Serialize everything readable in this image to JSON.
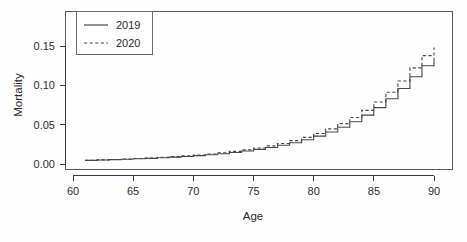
{
  "chart_data": {
    "type": "line",
    "title": "",
    "subtitle": "",
    "xlabel": "Age",
    "ylabel": "Mortality",
    "xlim": [
      60,
      90.5
    ],
    "ylim": [
      -0.004,
      0.168
    ],
    "grid": false,
    "step": true,
    "step_type": "hv",
    "legend_position": "top-left",
    "xticks": [
      60,
      65,
      70,
      75,
      80,
      85,
      90
    ],
    "xtick_labels": [
      "60",
      "65",
      "70",
      "75",
      "80",
      "85",
      "90"
    ],
    "yticks": [
      0.0,
      0.05,
      0.1,
      0.15
    ],
    "ytick_labels": [
      "0.00",
      "0.05",
      "0.10",
      "0.15"
    ],
    "x": [
      61,
      62,
      63,
      64,
      65,
      66,
      67,
      68,
      69,
      70,
      71,
      72,
      73,
      74,
      75,
      76,
      77,
      78,
      79,
      80,
      81,
      82,
      83,
      84,
      85,
      86,
      87,
      88,
      89,
      90
    ],
    "series": [
      {
        "name": "2019",
        "style": "solid",
        "color": "#474747",
        "values": [
          0.0046,
          0.005,
          0.0055,
          0.006,
          0.0066,
          0.0072,
          0.0079,
          0.0087,
          0.0096,
          0.0106,
          0.0118,
          0.0131,
          0.0147,
          0.0165,
          0.0186,
          0.021,
          0.0238,
          0.0271,
          0.0309,
          0.0354,
          0.0406,
          0.0467,
          0.0538,
          0.0621,
          0.0717,
          0.0829,
          0.0959,
          0.111,
          0.1248,
          0.135
        ]
      },
      {
        "name": "2020",
        "style": "dashed",
        "color": "#474747",
        "values": [
          0.0048,
          0.0053,
          0.0058,
          0.0064,
          0.007,
          0.0077,
          0.0085,
          0.0094,
          0.0104,
          0.0115,
          0.0128,
          0.0143,
          0.016,
          0.018,
          0.0203,
          0.023,
          0.0261,
          0.0297,
          0.0339,
          0.0388,
          0.0446,
          0.0513,
          0.0591,
          0.0682,
          0.0788,
          0.0912,
          0.1056,
          0.1222,
          0.1378,
          0.148
        ]
      }
    ],
    "legend": [
      {
        "label": "2019",
        "style": "solid"
      },
      {
        "label": "2020",
        "style": "dashed"
      }
    ],
    "colors": {
      "background": "#fefefe",
      "axis": "#3c3c3c",
      "frame": "#5a5a5a",
      "line": "#474747"
    }
  }
}
